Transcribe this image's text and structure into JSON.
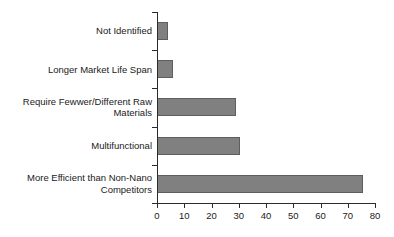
{
  "chart_data": {
    "type": "bar",
    "orientation": "horizontal",
    "title": "",
    "subtitle": "",
    "xlabel": "",
    "ylabel": "",
    "categories": [
      "Not Identified",
      "Longer Market Life Span",
      "Require Fewwer/Different Raw Materials",
      "Multifunctional",
      "More Efficient than Non-Nano Competitors"
    ],
    "category_lines": [
      [
        "Not Identified"
      ],
      [
        "Longer Market Life Span"
      ],
      [
        "Require Fewwer/Different Raw",
        "Materials"
      ],
      [
        "Multifunctional"
      ],
      [
        "More Efficient than Non-Nano",
        "Competitors"
      ]
    ],
    "values": [
      4,
      6,
      29,
      30.5,
      75.5
    ],
    "xlim": [
      0,
      80
    ],
    "xticks": [
      0,
      10,
      20,
      30,
      40,
      50,
      60,
      70,
      80
    ],
    "xtick_labels": [
      "0",
      "10",
      "20",
      "30",
      "40",
      "50",
      "60",
      "70",
      "80"
    ],
    "grid": false,
    "legend": null,
    "bar_color": "#808080",
    "bar_edge_color": "#5e5e5e",
    "axis_color": "#2b2b2b",
    "background": "#ffffff"
  }
}
